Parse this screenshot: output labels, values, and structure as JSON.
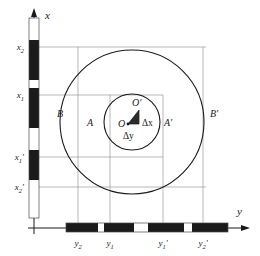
{
  "figure": {
    "background_color": "#ffffff",
    "ink_color": "#1a1a1a",
    "grid_color": "#9a9a9a",
    "band_black": "#1a1a1a",
    "band_white": "#ffffff"
  },
  "axes": {
    "x": {
      "label": "x",
      "orientation": "vertical",
      "arrow": "up",
      "origin_px": [
        34,
        228
      ],
      "tip_px": [
        34,
        10
      ]
    },
    "y": {
      "label": "y",
      "orientation": "horizontal",
      "arrow": "right",
      "origin_px": [
        34,
        228
      ],
      "tip_px": [
        250,
        228
      ]
    }
  },
  "circles": {
    "center_px": [
      132,
      122
    ],
    "inner": {
      "name": "inner-circle",
      "radius_px": 28,
      "left_label": "A",
      "right_label": "A'"
    },
    "outer": {
      "name": "outer-circle",
      "radius_px": 72,
      "left_label": "B",
      "right_label": "B'"
    }
  },
  "displacement": {
    "origin_label": "O",
    "displaced_label": "O'",
    "dx_label": "Δx",
    "dy_label": "Δy",
    "origin_px": [
      127,
      124
    ],
    "displaced_px": [
      139,
      110
    ]
  },
  "x_ticks": [
    {
      "label": "x",
      "sub": "2",
      "prime": "",
      "y_px": 47
    },
    {
      "label": "x",
      "sub": "1",
      "prime": "",
      "y_px": 95
    },
    {
      "label": "x",
      "sub": "1",
      "prime": "′",
      "y_px": 157
    },
    {
      "label": "x",
      "sub": "2",
      "prime": "′",
      "y_px": 187
    }
  ],
  "y_ticks": [
    {
      "label": "y",
      "sub": "2",
      "prime": "",
      "x_px": 78
    },
    {
      "label": "y",
      "sub": "1",
      "prime": "",
      "x_px": 110
    },
    {
      "label": "y",
      "sub": "1",
      "prime": "′",
      "x_px": 163
    },
    {
      "label": "y",
      "sub": "2",
      "prime": "′",
      "x_px": 203
    }
  ],
  "x_bands": [
    {
      "fill": "white",
      "y0": 18,
      "y1": 40
    },
    {
      "fill": "black",
      "y0": 40,
      "y1": 80
    },
    {
      "fill": "white",
      "y0": 80,
      "y1": 88
    },
    {
      "fill": "black",
      "y0": 88,
      "y1": 128
    },
    {
      "fill": "white",
      "y0": 128,
      "y1": 150
    },
    {
      "fill": "black",
      "y0": 150,
      "y1": 180
    },
    {
      "fill": "white",
      "y0": 180,
      "y1": 218
    }
  ],
  "y_bands": [
    {
      "fill": "black",
      "x0": 66,
      "x1": 98
    },
    {
      "fill": "white",
      "x0": 98,
      "x1": 104
    },
    {
      "fill": "black",
      "x0": 104,
      "x1": 134
    },
    {
      "fill": "white",
      "x0": 134,
      "x1": 148
    },
    {
      "fill": "black",
      "x0": 148,
      "x1": 184
    },
    {
      "fill": "white",
      "x0": 184,
      "x1": 192
    },
    {
      "fill": "black",
      "x0": 192,
      "x1": 228
    }
  ]
}
